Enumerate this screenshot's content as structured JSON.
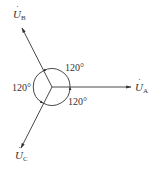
{
  "diagram": {
    "colors": {
      "line": "#333333",
      "background": "#ffffff"
    },
    "phasors": [
      {
        "id": "A",
        "label_base": "U",
        "label_sub": "A",
        "dot": "·",
        "angle_deg": 0
      },
      {
        "id": "B",
        "label_base": "U",
        "label_sub": "B",
        "dot": "·",
        "angle_deg": 120
      },
      {
        "id": "C",
        "label_base": "U",
        "label_sub": "C",
        "dot": "·",
        "angle_deg": 240
      }
    ],
    "angles": [
      {
        "between": "A-B",
        "text": "120°"
      },
      {
        "between": "B-C",
        "text": "120°"
      },
      {
        "between": "C-A",
        "text": "120°"
      }
    ]
  }
}
